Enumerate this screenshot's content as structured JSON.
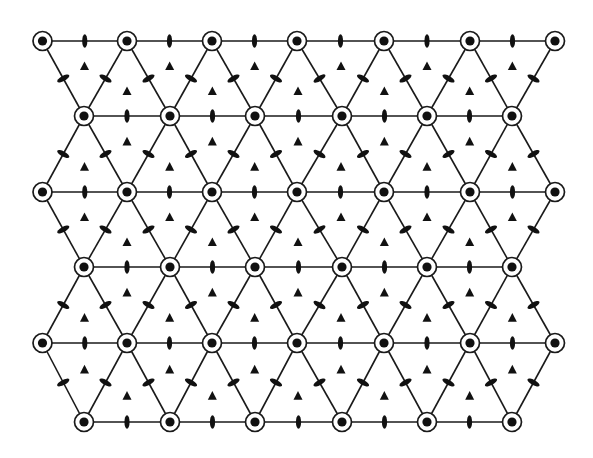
{
  "diagram": {
    "type": "symmetry-lattice",
    "colors": {
      "background": "#ffffff",
      "ink": "#111111"
    },
    "rows": [
      {
        "y": 41,
        "x": [
          42.5,
          127,
          212,
          297,
          384,
          470,
          555
        ]
      },
      {
        "y": 116,
        "x": [
          84,
          170,
          255,
          342,
          427,
          512
        ]
      },
      {
        "y": 192,
        "x": [
          42.5,
          127,
          212,
          297,
          384,
          470,
          555
        ]
      },
      {
        "y": 267,
        "x": [
          84,
          170,
          255,
          342,
          427,
          512
        ]
      },
      {
        "y": 343,
        "x": [
          42.5,
          127,
          212,
          297,
          384,
          470,
          555
        ]
      },
      {
        "y": 422,
        "x": [
          84,
          170,
          255,
          342,
          427,
          512
        ]
      }
    ],
    "symbols": {
      "node": {
        "name": "six-fold-axis",
        "outer_r": 9.5,
        "inner_r": 4.6
      },
      "edge_mark": {
        "name": "two-fold-axis",
        "rx": 2.6,
        "ry": 6.8
      },
      "centroid_mark": {
        "name": "three-fold-axis",
        "size": 9
      }
    }
  }
}
